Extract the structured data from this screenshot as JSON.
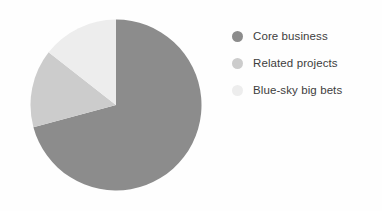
{
  "chart_data": {
    "type": "pie",
    "title": "",
    "subtitle": "",
    "xlabel": "",
    "ylabel": "",
    "grid": false,
    "legend_position": "right",
    "start_angle_deg": 0,
    "direction": "clockwise",
    "categories": [
      "Core business",
      "Related projects",
      "Blue-sky big bets"
    ],
    "values": [
      71,
      15,
      14
    ],
    "value_unit": "percent",
    "slices": [
      {
        "label": "Core business",
        "value": 71,
        "angle_deg": 255,
        "color": "#8c8c8c"
      },
      {
        "label": "Related projects",
        "value": 15,
        "angle_deg": 53,
        "color": "#cccccc"
      },
      {
        "label": "Blue-sky big bets",
        "value": 14,
        "angle_deg": 52,
        "color": "#ededed"
      }
    ],
    "annotations": []
  },
  "legend": {
    "items": [
      {
        "label": "Core business",
        "color": "#8c8c8c",
        "marker": "circle"
      },
      {
        "label": "Related projects",
        "color": "#cccccc",
        "marker": "circle"
      },
      {
        "label": "Blue-sky big bets",
        "color": "#ededed",
        "marker": "circle"
      }
    ]
  },
  "figure": {
    "background_color": "#fefefe",
    "text_color": "#3d3d3d"
  }
}
